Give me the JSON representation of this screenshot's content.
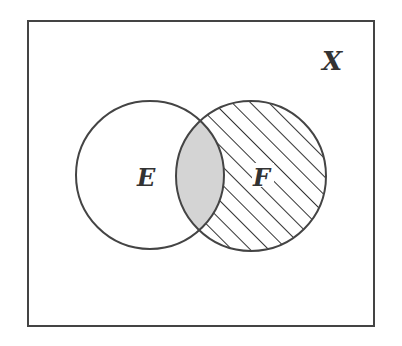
{
  "diagram": {
    "type": "venn",
    "universe_label": "X",
    "sets": [
      {
        "label": "E",
        "shading": "none"
      },
      {
        "label": "F",
        "shading": "hatched (F minus E)"
      }
    ],
    "intersection_shading": "gray",
    "colors": {
      "stroke": "#444444",
      "intersection_fill": "#d4d4d4",
      "hatch": "#333333",
      "background": "#ffffff"
    }
  }
}
